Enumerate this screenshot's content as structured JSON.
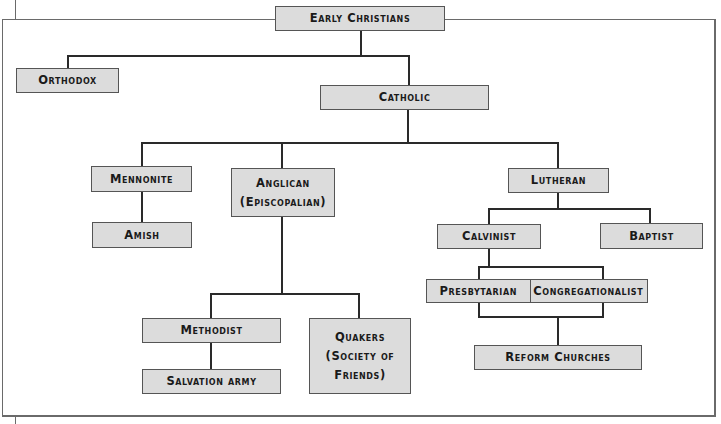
{
  "diagram": {
    "title_node": "Early Christians",
    "nodes": {
      "early_christians": "Early Christians",
      "orthodox": "Orthodox",
      "catholic": "Catholic",
      "mennonite": "Mennonite",
      "amish": "Amish",
      "anglican_line1": "Anglican",
      "anglican_line2": "(Episcopalian)",
      "methodist": "Methodist",
      "salvation_army": "Salvation army",
      "quakers_line1": "Quakers",
      "quakers_line2": "(Society of",
      "quakers_line3": "Friends)",
      "lutheran": "Lutheran",
      "calvinist": "Calvinist",
      "baptist": "Baptist",
      "presbyterian": "Presbytarian",
      "congregationalist": "Congregationalist",
      "reform_churches": "Reform Churches"
    },
    "edges": [
      [
        "Early Christians",
        "Orthodox"
      ],
      [
        "Early Christians",
        "Catholic"
      ],
      [
        "Catholic",
        "Mennonite"
      ],
      [
        "Catholic",
        "Anglican (Episcopalian)"
      ],
      [
        "Catholic",
        "Lutheran"
      ],
      [
        "Mennonite",
        "Amish"
      ],
      [
        "Anglican (Episcopalian)",
        "Methodist"
      ],
      [
        "Anglican (Episcopalian)",
        "Quakers (Society of Friends)"
      ],
      [
        "Methodist",
        "Salvation army"
      ],
      [
        "Lutheran",
        "Calvinist"
      ],
      [
        "Lutheran",
        "Baptist"
      ],
      [
        "Calvinist",
        "Presbytarian"
      ],
      [
        "Calvinist",
        "Congregationalist"
      ],
      [
        "Presbytarian",
        "Reform Churches"
      ],
      [
        "Congregationalist",
        "Reform Churches"
      ]
    ],
    "colors": {
      "box_fill": "#dcdcdc",
      "box_border": "#555555",
      "line": "#2a2a2a",
      "text": "#1a1a1a"
    }
  }
}
